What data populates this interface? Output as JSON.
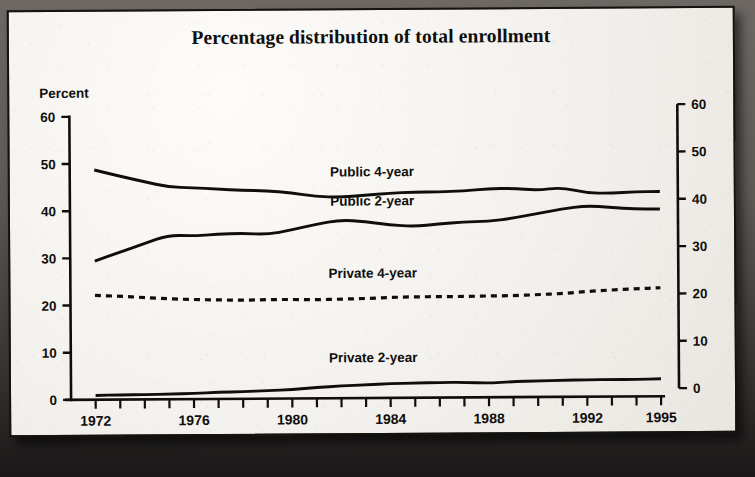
{
  "chart_data": {
    "type": "line",
    "title": "Percentage distribution of total enrollment",
    "xlabel": "Fall of year",
    "ylabel": "Percent",
    "ylabel_right": "",
    "xlim": [
      1971,
      1995
    ],
    "ylim": [
      0,
      60
    ],
    "y_ticks": [
      0,
      10,
      20,
      30,
      40,
      50,
      60
    ],
    "y_ticks_right": [
      0,
      10,
      20,
      30,
      40,
      50,
      60
    ],
    "x_ticks_labeled": [
      1972,
      1976,
      1980,
      1984,
      1988,
      1992,
      1995
    ],
    "x_tick_interval": 1,
    "grid": false,
    "legend_position": "inline-above-line",
    "x": [
      1972,
      1973,
      1974,
      1975,
      1976,
      1977,
      1978,
      1979,
      1980,
      1981,
      1982,
      1983,
      1984,
      1985,
      1986,
      1987,
      1988,
      1989,
      1990,
      1991,
      1992,
      1993,
      1994,
      1995
    ],
    "series": [
      {
        "name": "Public 4-year",
        "style": "solid",
        "color": "#100e0c",
        "values": [
          48.7,
          47.4,
          46.2,
          45.0,
          44.8,
          44.5,
          44.2,
          44.1,
          43.6,
          42.8,
          42.6,
          43.0,
          43.4,
          43.6,
          43.6,
          43.8,
          44.2,
          44.3,
          43.8,
          44.4,
          43.2,
          43.1,
          43.4,
          43.4
        ]
      },
      {
        "name": "Public 2-year",
        "style": "solid",
        "color": "#100e0c",
        "values": [
          29.4,
          31.2,
          33.0,
          34.8,
          34.6,
          34.9,
          35.1,
          34.8,
          35.7,
          36.9,
          37.8,
          37.4,
          36.7,
          36.3,
          36.8,
          37.2,
          37.3,
          37.9,
          38.9,
          39.8,
          40.5,
          40.1,
          39.7,
          39.7
        ]
      },
      {
        "name": "Private 4-year",
        "style": "dashed",
        "color": "#100e0c",
        "values": [
          22.1,
          21.9,
          21.6,
          21.3,
          21.1,
          21.0,
          20.9,
          21.0,
          21.0,
          20.9,
          21.0,
          21.1,
          21.3,
          21.4,
          21.4,
          21.4,
          21.5,
          21.5,
          21.7,
          21.9,
          22.3,
          22.6,
          22.8,
          23.0
        ]
      },
      {
        "name": "Private 2-year",
        "style": "solid",
        "color": "#100e0c",
        "values": [
          0.9,
          1.0,
          1.0,
          1.1,
          1.2,
          1.4,
          1.5,
          1.7,
          1.9,
          2.3,
          2.6,
          2.8,
          3.0,
          3.1,
          3.2,
          3.2,
          3.0,
          3.3,
          3.4,
          3.5,
          3.6,
          3.6,
          3.6,
          3.7
        ]
      }
    ],
    "annotations": [
      {
        "text": "Public 4-year",
        "x": 1983.3,
        "y": 47.0
      },
      {
        "text": "Public 2-year",
        "x": 1983.3,
        "y": 40.8
      },
      {
        "text": "Private 4-year",
        "x": 1983.3,
        "y": 25.5
      },
      {
        "text": "Private 2-year",
        "x": 1983.3,
        "y": 7.6
      }
    ]
  }
}
